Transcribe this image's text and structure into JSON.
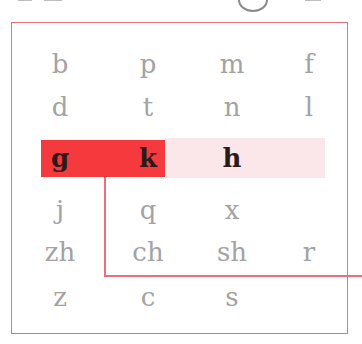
{
  "diagram": {
    "colors": {
      "frame": "#e8707e",
      "highlight": "#f6393d",
      "band": "#fbe6ea",
      "muted_text": "#a3a3a3",
      "active_text": "#2a1a1a"
    },
    "rows": [
      [
        "b",
        "p",
        "m",
        "f"
      ],
      [
        "d",
        "t",
        "n",
        "l"
      ],
      [
        "g",
        "k",
        "h",
        ""
      ],
      [
        "j",
        "q",
        "x",
        ""
      ],
      [
        "zh",
        "ch",
        "sh",
        "r"
      ],
      [
        "z",
        "c",
        "s",
        ""
      ]
    ],
    "highlighted_row": 2,
    "highlighted_cells": [
      "g",
      "k"
    ],
    "banded_cells": [
      "h"
    ]
  }
}
